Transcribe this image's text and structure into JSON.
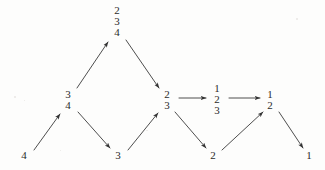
{
  "diagram": {
    "type": "directed-graph",
    "background_color": "#fdfdfc",
    "ink_color": "#2b2b2b",
    "width": 325,
    "height": 170,
    "nodes": [
      {
        "id": "n4",
        "label_lines": [
          "4"
        ],
        "x": 24,
        "y": 156,
        "row": "bottom"
      },
      {
        "id": "n34",
        "label_lines": [
          "3",
          "4"
        ],
        "x": 68,
        "y": 100,
        "row": "middle"
      },
      {
        "id": "n234",
        "label_lines": [
          "2",
          "3",
          "4"
        ],
        "x": 117,
        "y": 22,
        "row": "top"
      },
      {
        "id": "n3",
        "label_lines": [
          "3"
        ],
        "x": 118,
        "y": 156,
        "row": "bottom"
      },
      {
        "id": "n23",
        "label_lines": [
          "2",
          "3"
        ],
        "x": 167,
        "y": 100,
        "row": "middle"
      },
      {
        "id": "n123",
        "label_lines": [
          "1",
          "2",
          "3"
        ],
        "x": 217,
        "y": 100,
        "row": "middle"
      },
      {
        "id": "n2",
        "label_lines": [
          "2"
        ],
        "x": 213,
        "y": 156,
        "row": "bottom"
      },
      {
        "id": "n12",
        "label_lines": [
          "1",
          "2"
        ],
        "x": 270,
        "y": 100,
        "row": "middle"
      },
      {
        "id": "n1",
        "label_lines": [
          "1"
        ],
        "x": 309,
        "y": 156,
        "row": "bottom"
      }
    ],
    "edges": [
      {
        "id": "e1",
        "from": "n4",
        "to": "n34",
        "x1": 34,
        "y1": 150,
        "x2": 60,
        "y2": 114,
        "direction": "up-right"
      },
      {
        "id": "e2",
        "from": "n34",
        "to": "n234",
        "x1": 77,
        "y1": 88,
        "x2": 108,
        "y2": 42,
        "direction": "up-right"
      },
      {
        "id": "e3",
        "from": "n34",
        "to": "n3",
        "x1": 78,
        "y1": 112,
        "x2": 110,
        "y2": 148,
        "direction": "down-right"
      },
      {
        "id": "e4",
        "from": "n234",
        "to": "n23",
        "x1": 126,
        "y1": 40,
        "x2": 159,
        "y2": 88,
        "direction": "down-right"
      },
      {
        "id": "e5",
        "from": "n3",
        "to": "n23",
        "x1": 128,
        "y1": 150,
        "x2": 158,
        "y2": 113,
        "direction": "up-right"
      },
      {
        "id": "e6",
        "from": "n23",
        "to": "n123",
        "x1": 179,
        "y1": 98,
        "x2": 206,
        "y2": 98,
        "direction": "right"
      },
      {
        "id": "e7",
        "from": "n23",
        "to": "n2",
        "x1": 175,
        "y1": 112,
        "x2": 206,
        "y2": 148,
        "direction": "down-right"
      },
      {
        "id": "e8",
        "from": "n123",
        "to": "n12",
        "x1": 229,
        "y1": 98,
        "x2": 260,
        "y2": 98,
        "direction": "right"
      },
      {
        "id": "e9",
        "from": "n2",
        "to": "n12",
        "x1": 222,
        "y1": 150,
        "x2": 263,
        "y2": 112,
        "direction": "up-right"
      },
      {
        "id": "e10",
        "from": "n12",
        "to": "n1",
        "x1": 279,
        "y1": 112,
        "x2": 303,
        "y2": 148,
        "direction": "down-right"
      }
    ]
  }
}
